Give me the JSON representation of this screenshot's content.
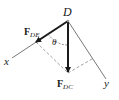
{
  "diagram": {
    "type": "force-vector-diagram",
    "point": {
      "label": "D"
    },
    "axes": [
      {
        "label": "x",
        "direction": "down-left"
      },
      {
        "label": "y",
        "direction": "down-right"
      }
    ],
    "vectors": [
      {
        "name": "F_DE",
        "symbol": "F",
        "subscript": "DE",
        "direction": "along x-axis"
      },
      {
        "name": "F_DC",
        "symbol": "F",
        "subscript": "DC",
        "direction": "vertical down"
      }
    ],
    "angle": {
      "label": "θ",
      "between": [
        "F_DE",
        "F_DC"
      ]
    },
    "components": "dashed projection lines of F_DC onto x and y axes",
    "colors": {
      "ink": "#1a1a1a",
      "dashed": "#8a8a8a",
      "axis": "#555555"
    }
  }
}
